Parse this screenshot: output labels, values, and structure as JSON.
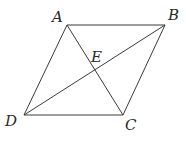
{
  "diagram": {
    "type": "parallelogram-with-diagonals",
    "points": {
      "A": "A",
      "B": "B",
      "C": "C",
      "D": "D",
      "E": "E"
    },
    "edges": [
      "AB",
      "BC",
      "CD",
      "DA",
      "AC",
      "BD"
    ],
    "intersection": {
      "point": "E",
      "of": [
        "AC",
        "BD"
      ]
    }
  }
}
